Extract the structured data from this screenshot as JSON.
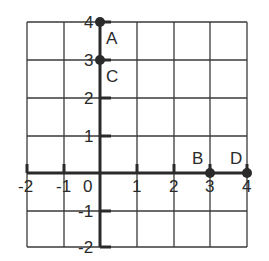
{
  "diagram": {
    "type": "coordinate-grid",
    "x_range": [
      -2,
      4
    ],
    "y_range": [
      -2,
      4
    ],
    "x_tick_labels": [
      "-2",
      "-1",
      "0",
      "1",
      "2",
      "3",
      "4"
    ],
    "y_tick_labels": [
      "4",
      "3",
      "2",
      "1",
      "-1",
      "-2"
    ],
    "origin_label": "0",
    "points": [
      {
        "label": "A",
        "x": 0,
        "y": 4
      },
      {
        "label": "C",
        "x": 0,
        "y": 3
      },
      {
        "label": "B",
        "x": 3,
        "y": 0
      },
      {
        "label": "D",
        "x": 4,
        "y": 0
      }
    ],
    "colors": {
      "ink": "#2a2a2a",
      "grid": "#3a3a3a",
      "background": "#ffffff"
    }
  }
}
